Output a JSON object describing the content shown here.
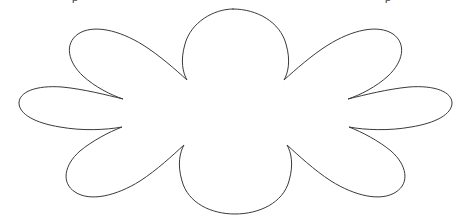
{
  "page": {
    "background_color": "#ffffff",
    "width": 467,
    "height": 222
  },
  "artwork": {
    "name": "scalloped-starburst-outline",
    "description": "Twelve-lobed scalloped flower / cloud-burst outline, unfilled",
    "stroke_color": "#3a3a3a",
    "fill_color": "#ffffff",
    "stroke_width": "1",
    "lobe_count": "12",
    "bounds": {
      "left": "16",
      "top": "9",
      "right": "452",
      "bottom": "214"
    },
    "path": "M 233 9 C 257 9 280 22 286 44 C 291 61 288 73 284 80 C 295 70 312 55 328 45 C 352 30 378 24 393 34 C 407 44 403 62 388 76 C 376 87 360 95 348 99 C 364 95 388 89 409 87 C 435 85 452 92 452 103 C 452 114 436 123 411 127 C 389 131 365 130 349 127 C 362 132 379 141 391 151 C 407 165 410 183 396 192 C 381 202 355 196 331 181 C 314 170 298 155 287 145 C 291 152 294 164 289 181 C 283 203 259 214 235 214 C 211 214 188 203 182 181 C 177 164 180 152 184 145 C 173 155 157 170 140 181 C 116 196 90 202 75 192 C 61 183 64 165 80 151 C 92 141 109 132 122 127 C 106 130 82 131 60 127 C 35 123 19 114 19 103 C 19 92 36 85 62 87 C 83 89 107 95 123 99 C 111 95 95 87 83 76 C 68 62 64 44 78 34 C 93 24 119 30 143 45 C 159 55 176 70 187 80 C 183 73 180 61 185 44 C 191 22 214 9 233 9 Z"
  },
  "clipped_text": {
    "left_fragment": "p",
    "right_fragment": "p"
  }
}
